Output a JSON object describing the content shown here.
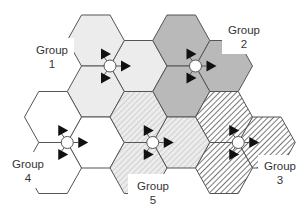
{
  "diagram": {
    "type": "hexagonal cell cluster diagram",
    "hex_edge": 28.5,
    "hex_height": 51,
    "groups": [
      {
        "id": 1,
        "label_line1": "Group",
        "label_line2": "1",
        "fill": "#ececec",
        "pattern": "none",
        "site": [
          110,
          66
        ],
        "label_pos": [
          52,
          54
        ],
        "label_box": [
          36,
          38,
          38,
          36
        ]
      },
      {
        "id": 2,
        "label_line1": "Group",
        "label_line2": "2",
        "fill": "#b9b9b9",
        "pattern": "none",
        "site": [
          195.5,
          66
        ],
        "label_pos": [
          244,
          34
        ],
        "label_box": [
          222,
          18,
          44,
          36
        ]
      },
      {
        "id": 3,
        "label_line1": "Group",
        "label_line2": "3",
        "fill": "#ffffff",
        "pattern": "dense-dark-hatch",
        "site": [
          238.25,
          142.5
        ],
        "label_pos": [
          280,
          170
        ],
        "label_box": [
          258,
          155,
          46,
          36
        ]
      },
      {
        "id": 4,
        "label_line1": "Group",
        "label_line2": "4",
        "fill": "#ffffff",
        "pattern": "none",
        "site": [
          67.25,
          142.5
        ],
        "label_pos": [
          28,
          168
        ],
        "label_box": [
          8,
          152,
          40,
          36
        ]
      },
      {
        "id": 5,
        "label_line1": "Group",
        "label_line2": "5",
        "fill": "#e6e6e6",
        "pattern": "light-hatch",
        "site": [
          152.75,
          142.5
        ],
        "label_pos": [
          153,
          190
        ],
        "label_box": [
          128,
          174,
          50,
          37
        ]
      }
    ],
    "colors": {
      "edge": "#555555",
      "arrow": "#111111",
      "site_fill": "#ffffff",
      "dark_hatch": "#555555",
      "light_hatch": "#c4c4c4",
      "label_text": "#333333"
    }
  }
}
